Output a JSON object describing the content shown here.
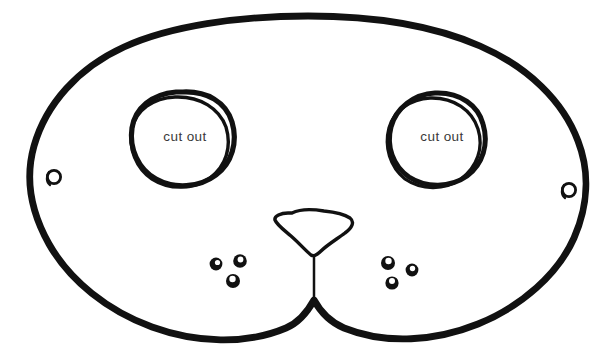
{
  "document": {
    "title": "Bear Face Mask Template",
    "description": "Hand-drawn printable animal face mask craft template outline",
    "background_color": "#ffffff",
    "ink_color": "#111111",
    "label_color": "#3a3a3a"
  },
  "diagram": {
    "type": "line-drawing",
    "outline": {
      "name": "mask-outline",
      "stroke_width": 6.5,
      "bounds": {
        "x": 30,
        "y": 13,
        "width": 556,
        "height": 329
      }
    },
    "eyes": [
      {
        "id": "left-eye",
        "label": "cut out",
        "center": {
          "x": 182,
          "y": 137
        },
        "radius": 46,
        "stroke_width": 4.2,
        "double_line": true
      },
      {
        "id": "right-eye",
        "label": "cut out",
        "center": {
          "x": 437,
          "y": 137
        },
        "radius": 44,
        "stroke_width": 4.2,
        "double_line": true
      }
    ],
    "strap_holes": [
      {
        "id": "left-strap-hole",
        "center": {
          "x": 54,
          "y": 177
        },
        "radius": 7,
        "stroke_width": 2.6
      },
      {
        "id": "right-strap-hole",
        "center": {
          "x": 569,
          "y": 190
        },
        "radius": 7,
        "stroke_width": 2.6
      }
    ],
    "nose": {
      "id": "nose",
      "shape": "rounded-triangle",
      "center": {
        "x": 312,
        "y": 230
      },
      "width": 78,
      "height": 48,
      "stroke_width": 3.2
    },
    "muzzle_line": {
      "id": "muzzle-line",
      "from": {
        "x": 314,
        "y": 255
      },
      "to": {
        "x": 314,
        "y": 300
      },
      "stroke_width": 2.4
    },
    "whisker_dot_groups": [
      {
        "id": "left-whisker-dots",
        "dots": [
          {
            "cx": 216,
            "cy": 264,
            "r": 6.2
          },
          {
            "cx": 240,
            "cy": 261,
            "r": 6.6
          },
          {
            "cx": 233,
            "cy": 281,
            "r": 6.8
          }
        ]
      },
      {
        "id": "right-whisker-dots",
        "dots": [
          {
            "cx": 388,
            "cy": 263,
            "r": 6.8
          },
          {
            "cx": 412,
            "cy": 270,
            "r": 6.2
          },
          {
            "cx": 392,
            "cy": 283,
            "r": 6.4
          }
        ]
      }
    ]
  },
  "labels": {
    "left_eye_cut_out": "cut out",
    "right_eye_cut_out": "cut out"
  }
}
